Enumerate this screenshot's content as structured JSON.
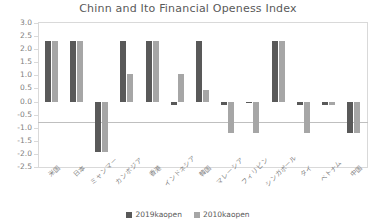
{
  "chart_data": {
    "type": "bar",
    "title": "Chinn and Ito Financial Openess Index",
    "xlabel": "",
    "ylabel": "",
    "ylim": [
      -2.5,
      3.0
    ],
    "ytick_step": 0.5,
    "grid": false,
    "legend_position": "bottom",
    "categories": [
      "米国",
      "日本",
      "ミャンマー",
      "カンボジア",
      "香港",
      "インドネシア",
      "韓国",
      "マレーシア",
      "フィリピン",
      "シンガポール",
      "タイ",
      "ベトナム",
      "中国"
    ],
    "yticks": [
      "3.0",
      "2.5",
      "2.0",
      "1.5",
      "1.0",
      "0.5",
      "0.0",
      "-0.5",
      "-1.0",
      "-1.5",
      "-2.0",
      "-2.5"
    ],
    "series": [
      {
        "name": "2019kaopen",
        "color": "#595959",
        "values": [
          2.32,
          2.32,
          -1.92,
          2.32,
          2.32,
          -0.13,
          2.32,
          -0.13,
          -0.05,
          2.32,
          -0.13,
          -0.13,
          -1.22
        ]
      },
      {
        "name": "2010kaopen",
        "color": "#a6a6a6",
        "values": [
          2.32,
          2.32,
          -1.92,
          1.05,
          2.32,
          1.05,
          0.43,
          -1.22,
          -1.22,
          2.32,
          -1.22,
          -0.13,
          -1.22
        ]
      }
    ]
  },
  "legend": {
    "items": [
      {
        "label": "2019kaopen",
        "color": "#595959"
      },
      {
        "label": "2010kaopen",
        "color": "#a6a6a6"
      }
    ]
  }
}
